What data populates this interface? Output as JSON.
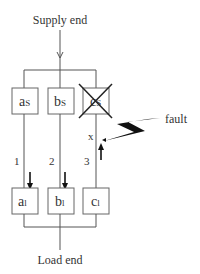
{
  "diagram": {
    "supply_label": "Supply end",
    "load_label": "Load end",
    "fault_label": "fault",
    "fault_point_label": "x",
    "supply_boxes": [
      {
        "main": "a",
        "sub": "S"
      },
      {
        "main": "b",
        "sub": "S"
      },
      {
        "main": "c",
        "sub": "S",
        "crossed": true
      }
    ],
    "load_boxes": [
      {
        "main": "a",
        "sub": "l"
      },
      {
        "main": "b",
        "sub": "l"
      },
      {
        "main": "c",
        "sub": "l"
      }
    ],
    "branch_labels": [
      "1",
      "2",
      "3"
    ],
    "colors": {
      "line": "#555555",
      "text": "#333333",
      "arrow": "#111111"
    }
  }
}
